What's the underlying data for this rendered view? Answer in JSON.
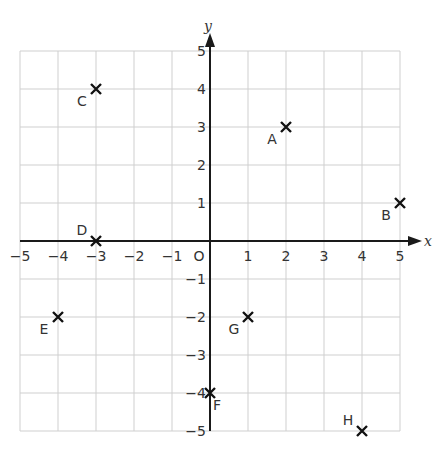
{
  "chart_data": {
    "type": "scatter",
    "title": "",
    "xlabel": "x",
    "ylabel": "y",
    "xlim": [
      -5,
      5
    ],
    "ylim": [
      -5,
      5
    ],
    "grid": true,
    "origin_label": "O",
    "x_ticks": [
      -5,
      -4,
      -3,
      -2,
      -1,
      1,
      2,
      3,
      4,
      5
    ],
    "y_ticks": [
      5,
      4,
      3,
      2,
      1,
      -1,
      -2,
      -3,
      -4,
      -5
    ],
    "marker": "x",
    "points": [
      {
        "label": "A",
        "x": 2,
        "y": 3,
        "label_pos": "bottom-left"
      },
      {
        "label": "B",
        "x": 5,
        "y": 1,
        "label_pos": "bottom-left"
      },
      {
        "label": "C",
        "x": -3,
        "y": 4,
        "label_pos": "bottom-left"
      },
      {
        "label": "D",
        "x": -3,
        "y": 0,
        "label_pos": "top-left"
      },
      {
        "label": "E",
        "x": -4,
        "y": -2,
        "label_pos": "bottom-left"
      },
      {
        "label": "F",
        "x": 0,
        "y": -4,
        "label_pos": "bottom-right"
      },
      {
        "label": "G",
        "x": 1,
        "y": -2,
        "label_pos": "bottom-left"
      },
      {
        "label": "H",
        "x": 4,
        "y": -5,
        "label_pos": "top-left"
      }
    ]
  },
  "colors": {
    "grid": "#cfcfcf",
    "axis": "#1a1a1a",
    "marker": "#111111",
    "text": "#333333"
  }
}
